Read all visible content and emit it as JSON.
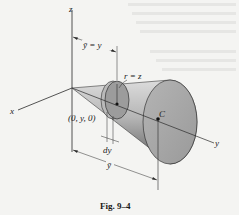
{
  "figure": {
    "caption": "Fig. 9–4",
    "colors": {
      "background": "#f4f4f2",
      "cone_light": "#d6d6d6",
      "cone_dark": "#6e6e6e",
      "base_face": "#a9a9a9",
      "disk_face": "#9c9c9c",
      "line": "#2a2a2a"
    },
    "axes": {
      "x_label": "x",
      "y_label": "y",
      "z_label": "z"
    },
    "labels": {
      "ybar_eq_y": "ȳ = y",
      "r_eq_z": "r = z",
      "point": "(0, y, 0)",
      "dy": "dy",
      "ybar": "ȳ",
      "centroid": "C"
    }
  }
}
